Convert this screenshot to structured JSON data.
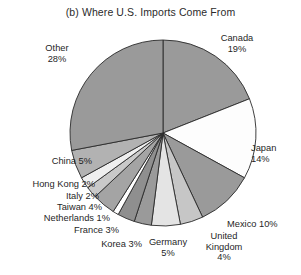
{
  "chart_data": {
    "type": "pie",
    "title": "(b) Where U.S. Imports Come From",
    "xlabel": "",
    "ylabel": "",
    "legend": "none",
    "grid": false,
    "units": "percent of U.S. imports",
    "start_angle_deg": 0,
    "direction": "clockwise",
    "categories": [
      "Canada",
      "Japan",
      "Mexico",
      "United Kingdom",
      "Germany",
      "Korea",
      "France",
      "Netherlands",
      "Taiwan",
      "Italy",
      "Hong Kong",
      "China",
      "Other"
    ],
    "values": [
      19,
      14,
      10,
      4,
      5,
      3,
      3,
      1,
      4,
      2,
      2,
      5,
      28
    ],
    "total": 100,
    "slices": [
      {
        "label": "Canada",
        "value": 19,
        "text": "Canada\n19%",
        "fill": "#9a9a9a"
      },
      {
        "label": "Japan",
        "value": 14,
        "text": "Japan\n14%",
        "fill": "#fdfdfd"
      },
      {
        "label": "Mexico",
        "value": 10,
        "text": "Mexico 10%",
        "fill": "#9a9a9a"
      },
      {
        "label": "United Kingdom",
        "value": 4,
        "text": "United\nKingdom\n4%",
        "fill": "#c6c6c6"
      },
      {
        "label": "Germany",
        "value": 5,
        "text": "Germany\n5%",
        "fill": "#e4e4e4"
      },
      {
        "label": "Korea",
        "value": 3,
        "text": "Korea 3%",
        "fill": "#9a9a9a"
      },
      {
        "label": "France",
        "value": 3,
        "text": "France 3%",
        "fill": "#8f8f8f"
      },
      {
        "label": "Netherlands",
        "value": 1,
        "text": "Netherlands 1%",
        "fill": "#ffffff"
      },
      {
        "label": "Taiwan",
        "value": 4,
        "text": "Taiwan 4%",
        "fill": "#a4a4a4"
      },
      {
        "label": "Italy",
        "value": 2,
        "text": "Italy 2%",
        "fill": "#c9c9c9"
      },
      {
        "label": "Hong Kong",
        "value": 2,
        "text": "Hong Kong 2%",
        "fill": "#efefef"
      },
      {
        "label": "China",
        "value": 5,
        "text": "China 5%",
        "fill": "#b2b2b2"
      },
      {
        "label": "Other",
        "value": 28,
        "text": "Other\n28%",
        "fill": "#9a9a9a"
      }
    ]
  },
  "labels": {
    "canada_line1": "Canada",
    "canada_line2": "19%",
    "japan_line1": "Japan",
    "japan_line2": "14%",
    "mexico": "Mexico 10%",
    "uk_line1": "United",
    "uk_line2": "Kingdom",
    "uk_line3": "4%",
    "germany_line1": "Germany",
    "germany_line2": "5%",
    "korea": "Korea 3%",
    "france": "France 3%",
    "netherlands": "Netherlands 1%",
    "taiwan": "Taiwan 4%",
    "italy": "Italy 2%",
    "hongkong": "Hong Kong 2%",
    "china": "China 5%",
    "other_line1": "Other",
    "other_line2": "28%"
  },
  "style": {
    "stroke": "#2a2a2a",
    "background": "#ffffff",
    "text_color": "#1f1f1f"
  }
}
